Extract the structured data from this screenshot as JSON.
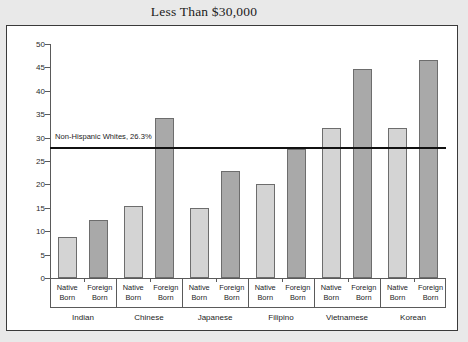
{
  "title": "Less Than $30,000",
  "reference": {
    "label": "Non-Hispanic Whites, 26.3%",
    "value": 26.3,
    "line_position": 27.9
  },
  "axis": {
    "ticks": [
      "50",
      "45",
      "40",
      "35",
      "30",
      "25",
      "20",
      "15",
      "10",
      "5",
      "0"
    ]
  },
  "nativity_labels": {
    "native": "Native\nBorn",
    "foreign": "Foreign\nBorn"
  },
  "colors": {
    "native_bar": "#d4d4d4",
    "foreign_bar": "#a9a9a9",
    "bar_border": "#6d6d6d",
    "reference_line": "#111111",
    "panel_background": "#ffffff",
    "page_background": "#e9e9e9"
  },
  "chart_data": {
    "type": "bar",
    "title": "Less Than $30,000",
    "xlabel": "",
    "ylabel": "",
    "ylim": [
      0,
      50
    ],
    "ytick_step": 5,
    "grid": false,
    "legend": "none",
    "categories": [
      "Indian",
      "Chinese",
      "Japanese",
      "Filipino",
      "Vietnamese",
      "Korean"
    ],
    "series": [
      {
        "name": "Native Born",
        "values": [
          8.8,
          15.3,
          15.0,
          20.1,
          32.1,
          32.1
        ]
      },
      {
        "name": "Foreign Born",
        "values": [
          12.3,
          34.2,
          22.8,
          27.5,
          44.7,
          46.5
        ]
      }
    ],
    "annotations": [
      {
        "text": "Non-Hispanic Whites, 26.3%",
        "type": "reference-line",
        "y": 27.9
      }
    ]
  }
}
